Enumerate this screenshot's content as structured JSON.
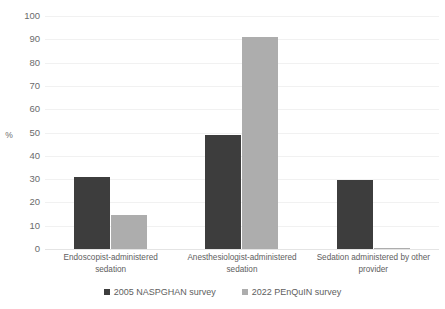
{
  "chart_data": {
    "type": "bar",
    "title": "",
    "xlabel": "",
    "ylabel": "%",
    "ylim": [
      0,
      100
    ],
    "ytick_step": 10,
    "yticks": [
      100,
      90,
      80,
      70,
      60,
      50,
      40,
      30,
      20,
      10,
      0
    ],
    "grid": true,
    "legend_position": "bottom",
    "categories": [
      "Endoscopist-administered sedation",
      "Anesthesiologist-administered sedation",
      "Sedation administered by other provider"
    ],
    "series": [
      {
        "name": "2005 NASPGHAN survey",
        "color": "#3d3d3d",
        "values": [
          31,
          49,
          29.5
        ]
      },
      {
        "name": "2022 PEnQuIN survey",
        "color": "#adadad",
        "values": [
          14.5,
          91,
          0.4
        ]
      }
    ]
  },
  "axis": {
    "y_title": "%",
    "tick_labels": [
      "100",
      "90",
      "80",
      "70",
      "60",
      "50",
      "40",
      "30",
      "20",
      "10",
      "0"
    ]
  },
  "category_labels": [
    {
      "line1": "Endoscopist-administered",
      "line2": "sedation"
    },
    {
      "line1": "Anesthesiologist-administered",
      "line2": "sedation"
    },
    {
      "line1": "Sedation administered by other",
      "line2": "provider"
    }
  ],
  "legend": {
    "entries": [
      {
        "label": "2005 NASPGHAN survey",
        "color": "#3d3d3d"
      },
      {
        "label": "2022 PEnQuIN survey",
        "color": "#adadad"
      }
    ]
  },
  "colors": {
    "series0": "#3d3d3d",
    "series1": "#adadad",
    "gridline": "#f1f1f1",
    "text": "#5e5e5e",
    "background": "#ffffff"
  }
}
